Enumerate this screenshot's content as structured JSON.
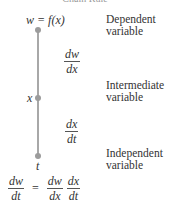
{
  "diagram": {
    "title": "Chain Rule",
    "top_node": {
      "expression": "w = f(x)",
      "label_line1": "Dependent",
      "label_line2": "variable"
    },
    "middle_node": {
      "expression": "x",
      "label_line1": "Intermediate",
      "label_line2": "variable"
    },
    "bottom_node": {
      "expression": "t",
      "label_line1": "Independent",
      "label_line2": "variable"
    },
    "upper_derivative": {
      "numerator": "dw",
      "denominator": "dx"
    },
    "lower_derivative": {
      "numerator": "dx",
      "denominator": "dt"
    },
    "equation": {
      "lhs": {
        "numerator": "dw",
        "denominator": "dt"
      },
      "equals": "=",
      "rhs": [
        {
          "numerator": "dw",
          "denominator": "dx"
        },
        {
          "numerator": "dx",
          "denominator": "dt"
        }
      ]
    },
    "colors": {
      "line": "#a8a8a8",
      "dot": "#9c9c9c",
      "text": "#333333"
    }
  }
}
